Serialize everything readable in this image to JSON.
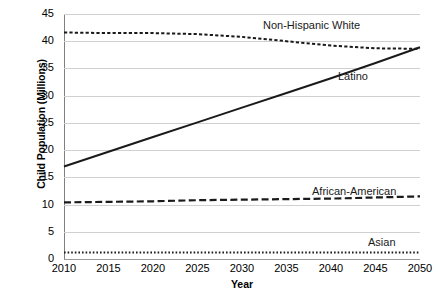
{
  "chart_data": {
    "type": "line",
    "title": "",
    "xlabel": "Year",
    "ylabel": "Child Population (Millions)",
    "x": [
      2010,
      2015,
      2020,
      2025,
      2030,
      2035,
      2040,
      2045,
      2050
    ],
    "xlim": [
      2010,
      2050
    ],
    "ylim": [
      0,
      45
    ],
    "yticks": [
      0,
      5,
      10,
      15,
      20,
      25,
      30,
      35,
      40,
      45
    ],
    "xticks": [
      "2010",
      "2015",
      "2020",
      "2025",
      "2030",
      "2035",
      "2040",
      "2045",
      "2050"
    ],
    "grid": true,
    "legend": "inline-labels",
    "series": [
      {
        "name": "Non-Hispanic White",
        "style": "dotted",
        "color": "#1a1a1a",
        "values": [
          41.6,
          41.5,
          41.5,
          41.3,
          40.8,
          40.0,
          39.2,
          38.7,
          38.6
        ]
      },
      {
        "name": "Latino",
        "style": "solid",
        "color": "#1a1a1a",
        "values": [
          17.0,
          19.7,
          22.4,
          25.1,
          27.8,
          30.5,
          33.2,
          36.0,
          38.9
        ]
      },
      {
        "name": "African-American",
        "style": "dashed",
        "color": "#1a1a1a",
        "values": [
          10.4,
          10.5,
          10.6,
          10.8,
          10.9,
          11.0,
          11.1,
          11.3,
          11.5
        ]
      },
      {
        "name": "Asian",
        "style": "fine-dotted",
        "color": "#1a1a1a",
        "values": [
          1.2,
          1.2,
          1.2,
          1.2,
          1.2,
          1.2,
          1.2,
          1.2,
          1.2
        ]
      }
    ],
    "annotations": [
      {
        "text": "Non-Hispanic White",
        "x": 263,
        "y": 20
      },
      {
        "text": "Latino",
        "x": 338,
        "y": 71
      },
      {
        "text": "African-American",
        "x": 312,
        "y": 186
      },
      {
        "text": "Asian",
        "x": 368,
        "y": 237
      }
    ],
    "source_note": ""
  }
}
